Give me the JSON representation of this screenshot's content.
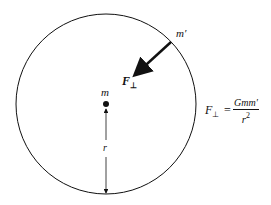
{
  "diagram": {
    "labels": {
      "mass_center": "m",
      "mass_orbit": "m′",
      "force": "F",
      "force_sub": "⊥",
      "radius": "r"
    },
    "equation": {
      "lhs": "F",
      "lhs_sub": "⊥",
      "equals": "=",
      "numerator": "Gmm′",
      "denominator": "r",
      "denominator_exp": "2"
    },
    "colors": {
      "stroke": "#111111",
      "background": "#ffffff"
    }
  }
}
